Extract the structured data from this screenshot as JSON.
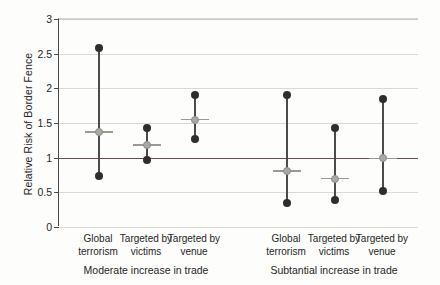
{
  "chart_data": {
    "type": "scatter",
    "title": "",
    "xlabel": "",
    "ylabel": "Relative Risk of Border Fence",
    "ylim": [
      0,
      3
    ],
    "yticks": [
      0,
      0.5,
      1,
      1.5,
      2,
      2.5,
      3
    ],
    "ytick_labels": [
      "0",
      "0.5",
      "1",
      "1.5",
      "2",
      "2.5",
      "3"
    ],
    "grid": true,
    "legend": "none",
    "reference_line": 1,
    "reference_line_label": "1",
    "reference_line_color": "#8f4a45",
    "marker_color": "#2e2e2e",
    "estimate_color": "#a9a9a4",
    "panels": [
      {
        "label": "Moderate increase in trade",
        "categories": [
          "Global terrorism",
          "Targeted by victims",
          "Targeted by venue"
        ]
      },
      {
        "label": "Subtantial increase in trade",
        "categories": [
          "Global terrorism",
          "Targeted by victims",
          "Targeted by venue"
        ]
      }
    ],
    "categories": [
      "Global terrorism",
      "Targeted by victims",
      "Targeted by venue",
      "Global terrorism",
      "Targeted by victims",
      "Targeted by venue"
    ],
    "points": [
      {
        "panel": "Moderate increase in trade",
        "category": "Global terrorism",
        "estimate": 1.37,
        "low": 0.73,
        "high": 2.58
      },
      {
        "panel": "Moderate increase in trade",
        "category": "Targeted by victims",
        "estimate": 1.18,
        "low": 0.97,
        "high": 1.43
      },
      {
        "panel": "Moderate increase in trade",
        "category": "Targeted by venue",
        "estimate": 1.55,
        "low": 1.27,
        "high": 1.91
      },
      {
        "panel": "Subtantial increase in trade",
        "category": "Global terrorism",
        "estimate": 0.81,
        "low": 0.34,
        "high": 1.91
      },
      {
        "panel": "Subtantial increase in trade",
        "category": "Targeted by victims",
        "estimate": 0.7,
        "low": 0.39,
        "high": 1.43
      },
      {
        "panel": "Subtantial increase in trade",
        "category": "Targeted by venue",
        "estimate": 0.99,
        "low": 0.52,
        "high": 1.85
      }
    ],
    "values": [
      1.37,
      1.18,
      1.55,
      0.81,
      0.7,
      0.99
    ]
  }
}
